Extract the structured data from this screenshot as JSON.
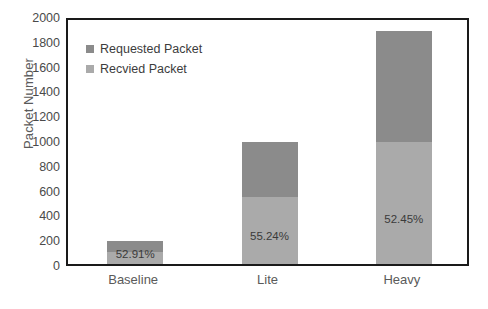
{
  "chart_data": {
    "type": "bar",
    "subtype": "stacked",
    "title": "",
    "xlabel": "",
    "ylabel": "Packet Number",
    "categories": [
      "Baseline",
      "Lite",
      "Heavy"
    ],
    "ylim": [
      0,
      2000
    ],
    "ytick_step": 200,
    "yticks": [
      "2000",
      "1800",
      "1600",
      "1400",
      "1200",
      "1000",
      "800",
      "600",
      "400",
      "200",
      "0"
    ],
    "grid": false,
    "legend_position": "top-left-inside",
    "series": [
      {
        "name": "Requested Packet",
        "color": "#8b8b8b",
        "values": [
          185,
          985,
          1880
        ],
        "note": "total stacked height (top segment is requested-minus-received portion)"
      },
      {
        "name": "Recvied Packet",
        "color": "#aaaaaa",
        "values": [
          98,
          544,
          986
        ]
      }
    ],
    "data_labels": [
      "52.91%",
      "55.24%",
      "52.45%"
    ],
    "colors": {
      "requested": "#8b8b8b",
      "received": "#aaaaaa",
      "axis": "#1a1a1a",
      "tick_text": "#4a4a4a",
      "label_text": "#5a5a5a",
      "plot_background": "#ffffff"
    }
  },
  "legend": {
    "items": [
      {
        "label": "Requested Packet",
        "color": "#8b8b8b"
      },
      {
        "label": "Recvied Packet",
        "color": "#aaaaaa"
      }
    ]
  }
}
